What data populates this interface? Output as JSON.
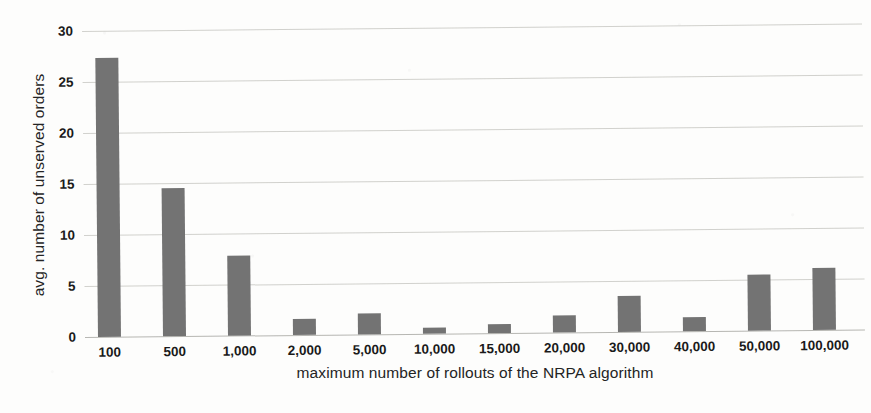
{
  "chart_data": {
    "type": "bar",
    "title": "",
    "xlabel": "maximum number of rollouts of the NRPA algorithm",
    "ylabel": "avg. number of unserved orders",
    "categories": [
      "100",
      "500",
      "1,000",
      "2,000",
      "5,000",
      "10,000",
      "15,000",
      "20,000",
      "30,000",
      "40,000",
      "50,000",
      "100,000"
    ],
    "values": [
      27.4,
      14.5,
      7.8,
      1.6,
      2.1,
      0.6,
      0.9,
      1.7,
      3.5,
      1.4,
      5.5,
      6.1
    ],
    "ylim": [
      0,
      30
    ],
    "yticks": [
      0,
      5,
      10,
      15,
      20,
      25,
      30
    ],
    "ytick_labels": [
      "0",
      "5",
      "10",
      "15",
      "20",
      "25",
      "30"
    ],
    "grid": true,
    "legend": "none",
    "bar_color": "#737373",
    "gridline_color": "#c9c9c4",
    "background_color": "#fdfdfc"
  }
}
